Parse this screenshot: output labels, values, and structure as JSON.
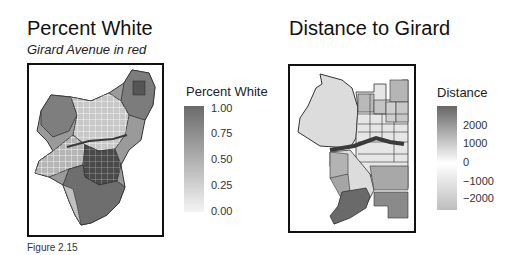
{
  "panels": [
    {
      "title": "Percent White",
      "subtitle": "Girard Avenue in red",
      "legend": {
        "title": "Percent White",
        "ticks": [
          "1.00",
          "0.75",
          "0.50",
          "0.25",
          "0.00"
        ],
        "color_high": "#6a6a6a",
        "color_low": "#f4f4f4"
      }
    },
    {
      "title": "Distance to Girard",
      "legend": {
        "title": "Distance",
        "ticks": [
          "2000",
          "1000",
          "0",
          "−1000",
          "−2000"
        ],
        "color_high": "#666666",
        "color_mid": "#ffffff",
        "color_low": "#bdbdbd"
      }
    }
  ],
  "caption": "Figure 2.15",
  "colors": {
    "girard_line": "#3a3a3a",
    "tract_border": "#333333"
  }
}
